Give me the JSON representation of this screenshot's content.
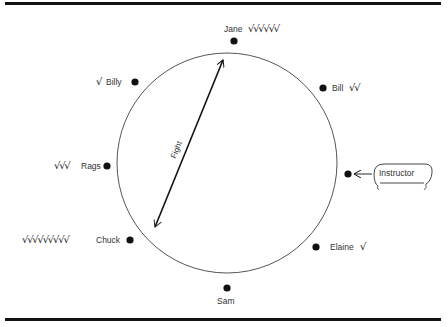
{
  "diagram": {
    "center_label": "Fight",
    "instructor": {
      "label": "Instructor"
    },
    "participants": [
      {
        "name": "Jane",
        "checks": "√√√√√√",
        "check_count": 6
      },
      {
        "name": "Bill",
        "checks": "√√",
        "check_count": 2
      },
      {
        "name": "Elaine",
        "checks": "√",
        "check_count": 1
      },
      {
        "name": "Sam",
        "checks": "",
        "check_count": 0
      },
      {
        "name": "Chuck",
        "checks": "√√√√√√√√√",
        "check_count": 9
      },
      {
        "name": "Rags",
        "checks": "√√√",
        "check_count": 3
      },
      {
        "name": "Billy",
        "checks": "√",
        "check_count": 1
      }
    ]
  }
}
